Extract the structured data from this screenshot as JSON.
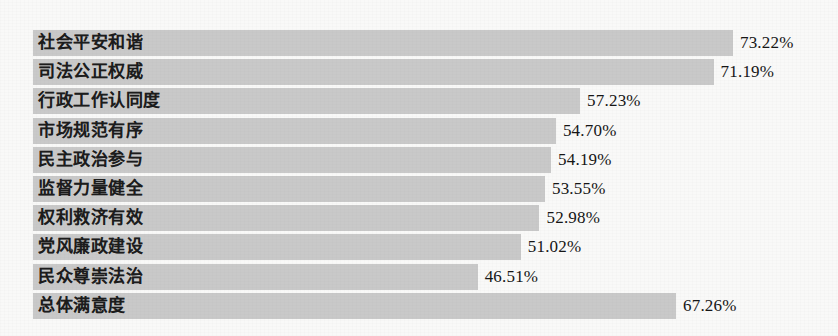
{
  "chart_data": {
    "type": "bar",
    "orientation": "horizontal",
    "title": "",
    "subtitle": "",
    "xlabel": "",
    "ylabel": "",
    "grid": false,
    "legend": null,
    "axis_visible": false,
    "value_suffix": "%",
    "xlim": [
      0,
      100
    ],
    "categories": [
      "社会平安和谐",
      "司法公正权威",
      "行政工作认同度",
      "市场规范有序",
      "民主政治参与",
      "监督力量健全",
      "权利救济有效",
      "党风廉政建设",
      "民众尊崇法治",
      "总体满意度"
    ],
    "values": [
      73.22,
      71.19,
      57.23,
      54.7,
      54.19,
      53.55,
      52.98,
      51.02,
      46.51,
      67.26
    ],
    "value_labels": [
      "73.22%",
      "71.19%",
      "57.23%",
      "54.70%",
      "54.19%",
      "53.55%",
      "52.98%",
      "51.02%",
      "46.51%",
      "67.26%"
    ],
    "series": [
      {
        "name": "满意度",
        "values": [
          73.22,
          71.19,
          57.23,
          54.7,
          54.19,
          53.55,
          52.98,
          51.02,
          46.51,
          67.26
        ]
      }
    ],
    "colors": {
      "bar": "#c9c9c9",
      "background": "#f9f9f8",
      "label_text": "#1c1c1c",
      "value_text": "#161616"
    }
  },
  "rows": [
    {
      "label": "社会平安和谐",
      "value": 73.22,
      "value_label": "73.22%"
    },
    {
      "label": "司法公正权威",
      "value": 71.19,
      "value_label": "71.19%"
    },
    {
      "label": "行政工作认同度",
      "value": 57.23,
      "value_label": "57.23%"
    },
    {
      "label": "市场规范有序",
      "value": 54.7,
      "value_label": "54.70%"
    },
    {
      "label": "民主政治参与",
      "value": 54.19,
      "value_label": "54.19%"
    },
    {
      "label": "监督力量健全",
      "value": 53.55,
      "value_label": "53.55%"
    },
    {
      "label": "权利救济有效",
      "value": 52.98,
      "value_label": "52.98%"
    },
    {
      "label": "党风廉政建设",
      "value": 51.02,
      "value_label": "51.02%"
    },
    {
      "label": "民众尊崇法治",
      "value": 46.51,
      "value_label": "46.51%"
    },
    {
      "label": "总体满意度",
      "value": 67.26,
      "value_label": "67.26%"
    }
  ]
}
